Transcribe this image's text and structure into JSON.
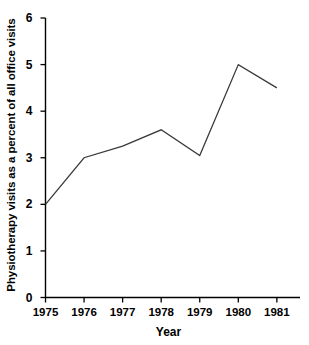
{
  "chart_data": {
    "type": "line",
    "title": "",
    "xlabel": "Year",
    "ylabel": "Physiotherapy visits as a percent of all office visits",
    "x": [
      1975,
      1976,
      1977,
      1978,
      1979,
      1980,
      1981
    ],
    "values": [
      2.0,
      3.0,
      3.25,
      3.6,
      3.05,
      5.0,
      4.5
    ],
    "series": [
      {
        "name": "Physiotherapy visits",
        "values": [
          2.0,
          3.0,
          3.25,
          3.6,
          3.05,
          5.0,
          4.5
        ]
      }
    ],
    "xtick_labels": [
      "1975",
      "1976",
      "1977",
      "1978",
      "1979",
      "1980",
      "1981"
    ],
    "ytick_labels": [
      "0",
      "1",
      "2",
      "3",
      "4",
      "5",
      "6"
    ],
    "ytick_values": [
      0,
      1,
      2,
      3,
      4,
      5,
      6
    ],
    "xlim": [
      1975,
      1981.6
    ],
    "ylim": [
      0,
      6
    ],
    "grid": false,
    "legend": false,
    "legend_position": "none",
    "line_color": "#3a3a3a",
    "axis_color": "#000000",
    "background_color": "#ffffff"
  }
}
